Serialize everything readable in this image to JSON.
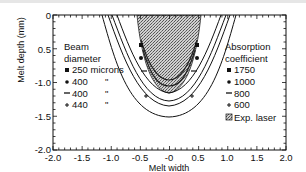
{
  "chart_data": {
    "type": "line",
    "title": "",
    "xlabel": "Melt width",
    "ylabel": "Melt depth (mm)",
    "xlim": [
      -2.0,
      2.0
    ],
    "ylim": [
      -2.0,
      0
    ],
    "x_ticks": [
      "-2.0",
      "-1.5",
      "-1.0",
      "-0.5",
      "-0",
      "0.5",
      "1.0",
      "1.5",
      "2.0"
    ],
    "y_ticks": [
      "0",
      "0.5",
      "-1.0",
      "-1.5",
      "-2.0"
    ],
    "grid": false,
    "legends": [
      {
        "title": [
          "Beam",
          "diameter"
        ],
        "position": "upper-left",
        "entries": [
          {
            "marker": "square",
            "label": "250 microns",
            "ditto": ""
          },
          {
            "marker": "circle",
            "label": "400",
            "ditto": "\""
          },
          {
            "marker": "dash",
            "label": "400",
            "ditto": "\""
          },
          {
            "marker": "plus",
            "label": "440",
            "ditto": "\""
          }
        ]
      },
      {
        "title": [
          "Absorption",
          "coefficient"
        ],
        "position": "upper-right",
        "entries": [
          {
            "marker": "square",
            "label": "1750"
          },
          {
            "marker": "circle",
            "label": "1000"
          },
          {
            "marker": "dash",
            "label": "800"
          },
          {
            "marker": "plus",
            "label": "600"
          },
          {
            "marker": "hatched-box",
            "label": "Exp. laser"
          }
        ]
      }
    ],
    "series": [
      {
        "name": "250 microns / 1750",
        "marker": "square",
        "top_half_width": 0.62,
        "max_depth": -1.15
      },
      {
        "name": "400 / 1000",
        "marker": "circle",
        "top_half_width": 0.68,
        "max_depth": -1.28
      },
      {
        "name": "400 / 800",
        "marker": "dash",
        "top_half_width": 0.75,
        "max_depth": -1.35
      },
      {
        "name": "440 / 600",
        "marker": "plus",
        "top_half_width": 0.85,
        "max_depth": -1.5
      },
      {
        "name": "Exp. laser",
        "type": "area",
        "top_half_width": 0.55,
        "max_depth": -1.15
      }
    ]
  }
}
